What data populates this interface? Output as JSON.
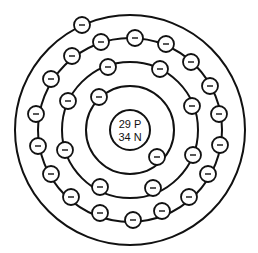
{
  "diagram": {
    "type": "atomic-model",
    "colors": {
      "line": "#111111",
      "fill": "#ffffff"
    },
    "center": [
      130,
      130
    ],
    "nucleus": {
      "radius": 20,
      "protons_label": "29 P",
      "neutrons_label": "34 N"
    },
    "electron_radius": 8,
    "electron_symbol": "−",
    "shells": [
      {
        "name": "shell-1",
        "radius": 44,
        "electron_count": 2,
        "electrons": [
          [
            99,
            97
          ],
          [
            157,
            157
          ]
        ]
      },
      {
        "name": "shell-2",
        "radius": 68,
        "electron_count": 8,
        "electrons": [
          [
            108,
            67
          ],
          [
            160,
            69
          ],
          [
            68,
            101
          ],
          [
            192,
            106
          ],
          [
            65,
            150
          ],
          [
            193,
            155
          ],
          [
            100,
            187
          ],
          [
            153,
            188
          ]
        ]
      },
      {
        "name": "shell-3",
        "radius": 92,
        "electron_count": 18,
        "electrons": [
          [
            101,
            42
          ],
          [
            135,
            38
          ],
          [
            166,
            44
          ],
          [
            191,
            62
          ],
          [
            210,
            86
          ],
          [
            219,
            114
          ],
          [
            72,
            56
          ],
          [
            51,
            79
          ],
          [
            36,
            114
          ],
          [
            38,
            146
          ],
          [
            51,
            174
          ],
          [
            71,
            197
          ],
          [
            100,
            213
          ],
          [
            133,
            220
          ],
          [
            162,
            211
          ],
          [
            189,
            197
          ],
          [
            208,
            174
          ],
          [
            220,
            145
          ]
        ]
      },
      {
        "name": "shell-4",
        "radius": 115,
        "electron_count": 1,
        "electrons": [
          [
            82,
            25
          ]
        ]
      }
    ]
  }
}
